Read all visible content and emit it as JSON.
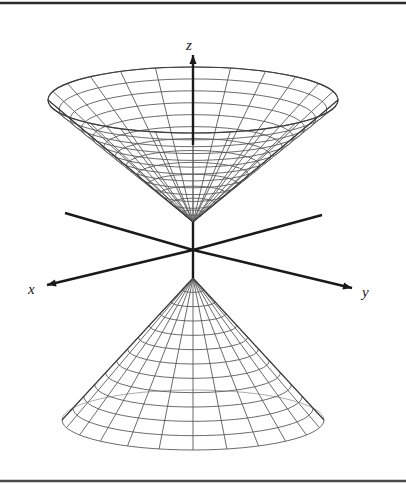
{
  "figure": {
    "kind": "double-cone-wireframe",
    "background_color": "#ffffff",
    "width": 406,
    "height": 485
  },
  "frame": {
    "top_border_color": "#2b2b2b",
    "bottom_border_color": "#4a4a4a",
    "top_border_y": 3,
    "bottom_border_y": 481,
    "border_thickness": 2.5,
    "left_x": 0,
    "right_x": 406
  },
  "axes": {
    "origin": {
      "x": 193,
      "y": 250
    },
    "color": "#1a1a1a",
    "thickness": 2.4,
    "arrow_size": 9,
    "items": [
      {
        "name": "z-axis",
        "label": "z",
        "label_x": 186,
        "label_y": 38,
        "tip_x": 193,
        "tip_y": 55,
        "arrow": true,
        "occluded_from_y": 145,
        "occluded_to_y": 222
      },
      {
        "name": "x-axis",
        "label": "x",
        "label_x": 28,
        "label_y": 282,
        "tip_x": 47,
        "tip_y": 285,
        "arrow": true
      },
      {
        "name": "y-axis",
        "label": "y",
        "label_x": 362,
        "label_y": 285,
        "tip_x": 352,
        "tip_y": 288,
        "arrow": true
      },
      {
        "name": "x-axis-negative",
        "label": "",
        "tip_x": 322,
        "tip_y": 215,
        "arrow": false
      },
      {
        "name": "y-axis-negative",
        "label": "",
        "tip_x": 65,
        "tip_y": 213,
        "arrow": false
      }
    ]
  },
  "chart_data": {
    "type": "surface",
    "xlabel": "x",
    "ylabel": "y",
    "zlabel": "z",
    "grid": true,
    "legend": "none",
    "surface_equation": "z^2 = x^2 + y^2",
    "projection": {
      "origin_x": 193,
      "origin_y": 250,
      "ellipse_flatten": 0.225,
      "description": "oblique view from slightly above the xy-plane"
    },
    "nappes": [
      {
        "name": "upper-nappe",
        "apex": {
          "x": 193,
          "y": 222
        },
        "rim_y": 100,
        "rim_radius_x": 145,
        "rim_radius_y": 33,
        "height_px": 122,
        "meridian_count": 24,
        "ring_count": 13,
        "interior_visible": true,
        "stroke_color": "#5a5a5a",
        "stroke_width": 0.9
      },
      {
        "name": "lower-nappe",
        "apex": {
          "x": 193,
          "y": 278
        },
        "rim_y": 420,
        "rim_radius_x": 131,
        "rim_radius_y": 30,
        "height_px": 142,
        "meridian_count": 24,
        "ring_count": 12,
        "interior_visible": false,
        "stroke_color": "#5a5a5a",
        "stroke_width": 0.9
      }
    ]
  }
}
